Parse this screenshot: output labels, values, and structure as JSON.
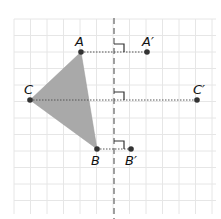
{
  "diagram": {
    "type": "reflection",
    "colors": {
      "grid": "#e6e6e6",
      "triangle_fill": "#a9a9a9",
      "mirror_line": "#888888",
      "point": "#333333",
      "dotted": "#555555"
    },
    "points": [
      {
        "name": "A",
        "label": "A"
      },
      {
        "name": "B",
        "label": "B"
      },
      {
        "name": "C",
        "label": "C"
      },
      {
        "name": "A-prime",
        "label": "A′"
      },
      {
        "name": "B-prime",
        "label": "B′"
      },
      {
        "name": "C-prime",
        "label": "C′"
      }
    ]
  }
}
